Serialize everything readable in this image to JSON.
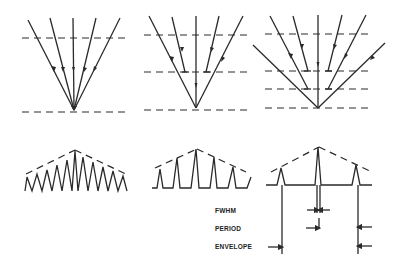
{
  "figure": {
    "panels_top": [
      {
        "id": "ray-diagram-1",
        "description": "five converging rays to single focal point, two dashed levels"
      },
      {
        "id": "ray-diagram-2",
        "description": "rays converging with intermediate reflecting level, three dashed levels"
      },
      {
        "id": "ray-diagram-3",
        "description": "rays converging with two intermediate levels, four dashed levels"
      }
    ],
    "panels_bottom": [
      {
        "id": "spectrum-1",
        "description": "dense sawtooth peaks under triangular dashed envelope"
      },
      {
        "id": "spectrum-2",
        "description": "separated peaks under triangular dashed envelope"
      },
      {
        "id": "spectrum-3",
        "description": "three sharp peaks under dashed envelope with dimension markers"
      }
    ],
    "labels": {
      "fwhm": "FWHM",
      "period": "PERIOD",
      "envelope": "ENVELOPE"
    },
    "colors": {
      "ink": "#2a2a2a",
      "background": "#ffffff"
    }
  }
}
